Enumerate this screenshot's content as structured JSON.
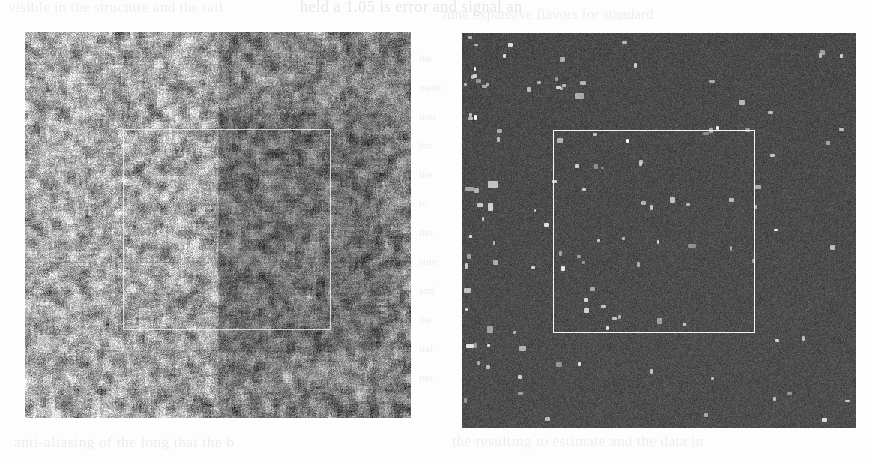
{
  "page": {
    "width": 871,
    "height": 458,
    "background": "#fdfdfd",
    "kind": "scanned-journal-page-figure"
  },
  "ghost_text": {
    "top_left": "visible in the structure and the tail",
    "top_right": "held  a 1.05 is error  and  signal  an",
    "top_right_2": "nine expansive flavors for  standard",
    "bottom_left": "anti-aliasing of the long  that  the  b",
    "bottom_right": "the resulting  to  estimate  and  the  data  in",
    "left_column": [
      "the",
      "ment",
      "tion",
      "for",
      "the",
      "lo",
      "tho",
      "sure",
      "and",
      "the",
      "tial",
      "per"
    ]
  },
  "figure": {
    "panels": [
      {
        "id": "panel-left",
        "name": "left-noise-image",
        "label": "",
        "x": 25,
        "y": 32,
        "width": 386,
        "height": 386,
        "style": "bright-grayscale-speckle",
        "base_color": "#a9a9a9",
        "mean_level": 168,
        "noise_sigma": 46,
        "has_dark_right_band": true,
        "roi": {
          "x_pct": 25.4,
          "y_pct": 25.1,
          "w_pct": 53.9,
          "h_pct": 52.2,
          "color": "#f5f5f5"
        }
      },
      {
        "id": "panel-right",
        "name": "right-detection-image",
        "label": "",
        "x": 462,
        "y": 33,
        "width": 394,
        "height": 395,
        "style": "dark-field-with-bright-dots",
        "base_color": "#4a4a4a",
        "mean_level": 74,
        "noise_sigma": 9,
        "dot_color": "#d8d8d8",
        "dot_count": 118,
        "dot_bias": "left-and-upper-left",
        "roi": {
          "x_pct": 23.1,
          "y_pct": 24.6,
          "w_pct": 51.3,
          "h_pct": 51.4,
          "color": "#fcfcfc"
        }
      }
    ]
  },
  "chart_data": {
    "type": "heatmap",
    "title": "",
    "xlabel": "",
    "ylabel": "",
    "panels": [
      {
        "name": "left",
        "description": "High-variance grayscale speckle field; right half slightly darker than left half; white rectangular region-of-interest outline drawn over the centre-right.",
        "grid": [
          386,
          386
        ],
        "value_range": [
          20,
          255
        ],
        "mean": 168,
        "std": 46,
        "regions": [
          {
            "name": "left-half",
            "x_pct": [
              0,
              50
            ],
            "y_pct": [
              0,
              100
            ],
            "mean": 176
          },
          {
            "name": "right-half",
            "x_pct": [
              50,
              100
            ],
            "y_pct": [
              0,
              100
            ],
            "mean": 152
          },
          {
            "name": "roi-interior",
            "x_pct": [
              25,
              79
            ],
            "y_pct": [
              25,
              77
            ],
            "mean": 146
          }
        ]
      },
      {
        "name": "right",
        "description": "Low-variance dark field with ~118 bright isolated detections; detections cluster in the left third and upper-left quadrant and are sparse on the right. White rectangular region-of-interest outline drawn over the centre-left.",
        "grid": [
          394,
          395
        ],
        "value_range": [
          55,
          235
        ],
        "mean": 74,
        "std": 9,
        "regions": [
          {
            "name": "left-third",
            "x_pct": [
              0,
              33
            ],
            "y_pct": [
              0,
              100
            ],
            "detections": 61
          },
          {
            "name": "middle-third",
            "x_pct": [
              33,
              66
            ],
            "y_pct": [
              0,
              100
            ],
            "detections": 44
          },
          {
            "name": "right-third",
            "x_pct": [
              66,
              100
            ],
            "y_pct": [
              0,
              100
            ],
            "detections": 13
          }
        ]
      }
    ],
    "legend": [],
    "grid_on": false
  }
}
